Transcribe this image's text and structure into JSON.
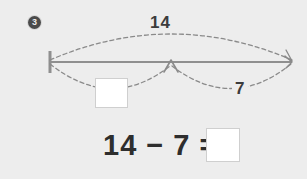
{
  "page": {
    "background_color": "#ededed",
    "width": 307,
    "height": 179
  },
  "problem": {
    "number": "3",
    "badge_color": "#4a4a4a"
  },
  "diagram": {
    "type": "number-line-part-whole",
    "line_color": "#8f8f8f",
    "arc_color": "#8a8a8a",
    "total_label": "14",
    "known_part_label": "7",
    "unknown_part_label": "",
    "left_endpoint_marker": "tick-mark",
    "middle_marker": "up-arrow",
    "right_endpoint_marker": "arrowhead"
  },
  "equation": {
    "text": "14 − 7 =",
    "minuend": "14",
    "subtrahend": "7",
    "answer": ""
  },
  "icons": {
    "badge": "numbered-circle-icon",
    "arrow_up": "arrow-up-icon",
    "arrow_right": "arrow-right-icon"
  }
}
